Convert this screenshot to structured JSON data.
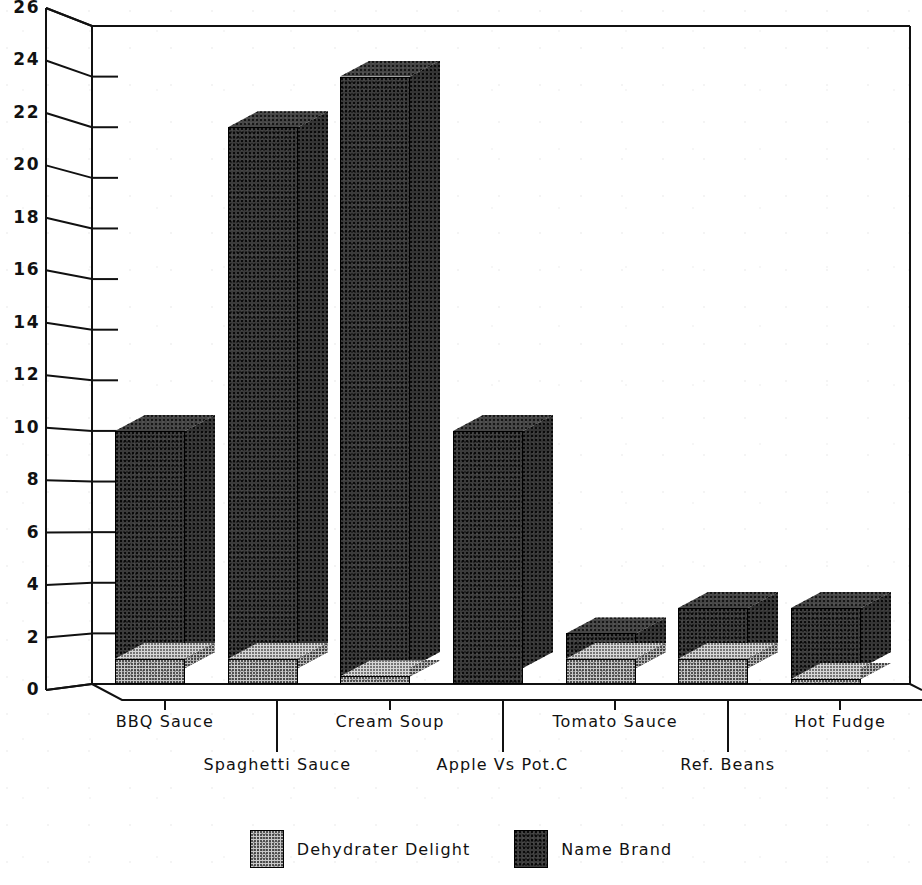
{
  "chart_data": {
    "type": "bar",
    "title": "",
    "subtitle": "",
    "xlabel": "",
    "ylabel": "",
    "ylim": [
      0,
      26
    ],
    "ytick_step": 2,
    "yticks": [
      "0",
      "2",
      "4",
      "6",
      "8",
      "10",
      "12",
      "14",
      "16",
      "18",
      "20",
      "22",
      "24",
      "26"
    ],
    "grid": false,
    "legend_position": "bottom-center",
    "style": "3d-perspective-bar",
    "categories": [
      "BBQ Sauce",
      "Spaghetti Sauce",
      "Cream Soup",
      "Apple Vs Pot.C",
      "Tomato Sauce",
      "Ref. Beans",
      "Hot Fudge"
    ],
    "series": [
      {
        "name": "Dehydrater Delight",
        "color": "#c9c9c9",
        "values": [
          1,
          1,
          0.3,
          0,
          1,
          1,
          0.2
        ]
      },
      {
        "name": "Name Brand",
        "color": "#3b3b3b",
        "values": [
          10,
          22,
          24,
          10,
          2,
          3,
          3
        ]
      }
    ]
  },
  "legend": {
    "entries": [
      {
        "label": "Dehydrater Delight",
        "swatch": "light"
      },
      {
        "label": "Name Brand",
        "swatch": "dark"
      }
    ]
  },
  "colors": {
    "light_series": "#c9c9c9",
    "dark_series": "#3b3b3b",
    "axis": "#111111",
    "background": "#ffffff"
  }
}
